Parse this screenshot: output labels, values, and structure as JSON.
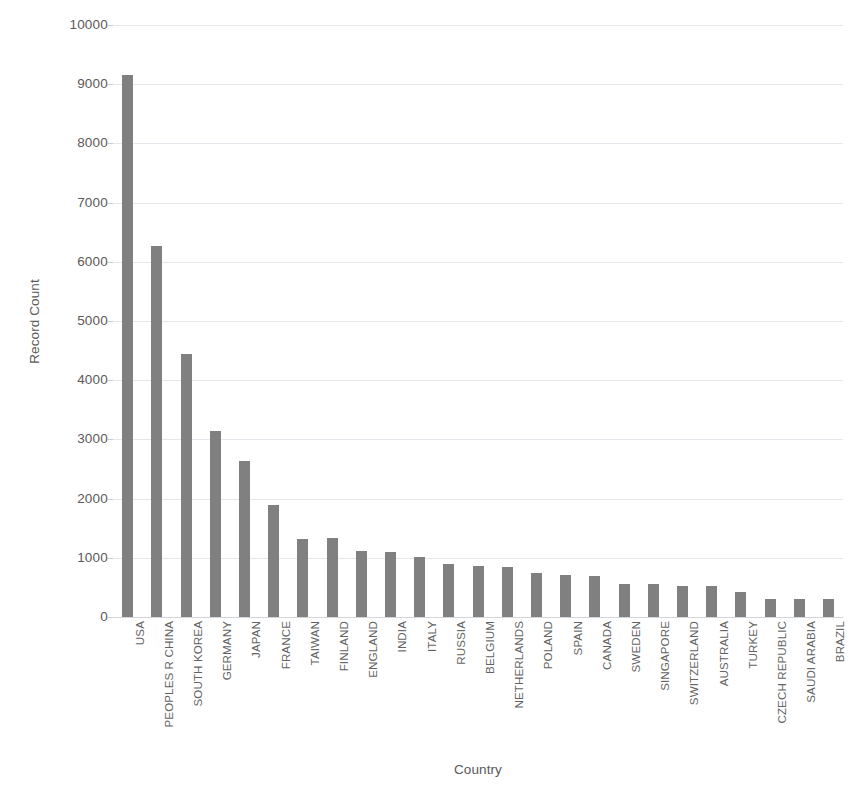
{
  "chart_data": {
    "type": "bar",
    "title": "",
    "xlabel": "Country",
    "ylabel": "Record Count",
    "categories": [
      "USA",
      "PEOPLES R CHINA",
      "SOUTH KOREA",
      "GERMANY",
      "JAPAN",
      "FRANCE",
      "TAIWAN",
      "FINLAND",
      "ENGLAND",
      "INDIA",
      "ITALY",
      "RUSSIA",
      "BELGIUM",
      "NETHERLANDS",
      "POLAND",
      "SPAIN",
      "CANADA",
      "SWEDEN",
      "SINGAPORE",
      "SWITZERLAND",
      "AUSTRALIA",
      "TURKEY",
      "CZECH REPUBLIC",
      "SAUDI ARABIA",
      "BRAZIL"
    ],
    "values": [
      9150,
      6260,
      4450,
      3140,
      2630,
      1900,
      1320,
      1330,
      1110,
      1090,
      1010,
      890,
      870,
      840,
      740,
      710,
      690,
      560,
      555,
      530,
      520,
      420,
      310,
      305,
      300
    ],
    "ylim": [
      0,
      10000
    ],
    "ytick_step": 1000,
    "yticks": [
      "0",
      "1000",
      "2000",
      "3000",
      "4000",
      "5000",
      "6000",
      "7000",
      "8000",
      "9000",
      "10000"
    ],
    "grid": true,
    "legend": false,
    "bar_color": "#808080",
    "gridline_color": "#e4e8ec",
    "text_color": "#595959",
    "background_color": "#ffffff"
  }
}
